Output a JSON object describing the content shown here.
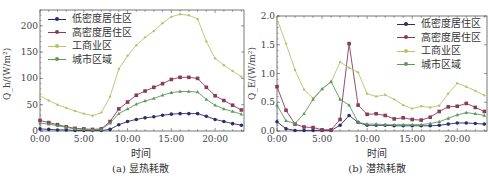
{
  "legend": [
    "低密度居住区",
    "高密度居住区",
    "工商业区",
    "城市区域"
  ],
  "colors": {
    "low": "#2b2d6b",
    "high": "#8a3a5a",
    "commercial": "#b5c46a",
    "urban": "#5a9a5a"
  },
  "chart_data": [
    {
      "type": "line",
      "title": "(a) 显热耗散",
      "xlabel": "时间",
      "ylabel": "Q_h/(W/m²)",
      "x_ticks": [
        "0:00",
        "5:00",
        "10:00",
        "15:00",
        "20:00"
      ],
      "y_ticks": [
        0,
        50,
        100,
        150,
        200
      ],
      "ylim": [
        0,
        230
      ],
      "x": [
        0,
        1,
        2,
        3,
        4,
        5,
        6,
        7,
        8,
        9,
        10,
        11,
        12,
        13,
        14,
        15,
        16,
        17,
        18,
        19,
        20,
        21,
        22,
        23
      ],
      "series": [
        {
          "name": "低密度居住区",
          "values": [
            4,
            3,
            2,
            2,
            1,
            1,
            1,
            1,
            3,
            12,
            18,
            22,
            25,
            27,
            30,
            32,
            33,
            33,
            33,
            28,
            22,
            18,
            14,
            11
          ]
        },
        {
          "name": "高密度居住区",
          "values": [
            20,
            16,
            12,
            8,
            5,
            4,
            3,
            4,
            18,
            42,
            55,
            68,
            76,
            83,
            90,
            98,
            102,
            102,
            100,
            83,
            67,
            58,
            49,
            40
          ]
        },
        {
          "name": "工商业区",
          "values": [
            67,
            58,
            50,
            44,
            38,
            33,
            29,
            35,
            65,
            118,
            143,
            163,
            178,
            190,
            205,
            217,
            222,
            220,
            213,
            170,
            138,
            125,
            114,
            103
          ]
        },
        {
          "name": "城市区域",
          "values": [
            15,
            13,
            10,
            7,
            4,
            3,
            2,
            3,
            15,
            33,
            42,
            51,
            57,
            62,
            68,
            73,
            75,
            75,
            74,
            60,
            49,
            42,
            37,
            32
          ]
        }
      ]
    },
    {
      "type": "line",
      "title": "(b) 潜热耗散",
      "xlabel": "时间",
      "ylabel": "Q_E/(W/m²)",
      "x_ticks": [
        "0:00",
        "5:00",
        "10:00",
        "15:00",
        "20:00"
      ],
      "y_ticks": [
        0.0,
        0.5,
        1.0,
        1.5,
        2.0
      ],
      "ylim": [
        0,
        2.0
      ],
      "x": [
        0,
        1,
        2,
        3,
        4,
        5,
        6,
        7,
        8,
        9,
        10,
        11,
        12,
        13,
        14,
        15,
        16,
        17,
        18,
        19,
        20,
        21,
        22,
        23
      ],
      "series": [
        {
          "name": "低密度居住区",
          "values": [
            0.16,
            0.04,
            0.01,
            0.01,
            0.01,
            0.01,
            0.01,
            0.1,
            0.27,
            0.15,
            0.1,
            0.1,
            0.1,
            0.09,
            0.09,
            0.09,
            0.09,
            0.09,
            0.1,
            0.12,
            0.14,
            0.14,
            0.13,
            0.12
          ]
        },
        {
          "name": "高密度居住区",
          "values": [
            0.77,
            0.36,
            0.12,
            0.07,
            0.06,
            0.02,
            0.02,
            0.2,
            1.52,
            0.45,
            0.29,
            0.3,
            0.27,
            0.21,
            0.23,
            0.2,
            0.19,
            0.24,
            0.34,
            0.42,
            0.43,
            0.48,
            0.41,
            0.34
          ]
        },
        {
          "name": "工商业区",
          "values": [
            1.95,
            1.52,
            1.06,
            0.72,
            0.57,
            0.73,
            0.85,
            1.2,
            1.1,
            1.02,
            0.65,
            0.6,
            0.63,
            0.55,
            0.45,
            0.39,
            0.43,
            0.41,
            0.44,
            0.65,
            0.83,
            0.77,
            0.7,
            0.62
          ]
        },
        {
          "name": "城市区域",
          "values": [
            0.45,
            0.18,
            0.13,
            0.3,
            0.55,
            0.73,
            0.86,
            0.55,
            0.45,
            0.15,
            0.12,
            0.12,
            0.11,
            0.11,
            0.11,
            0.11,
            0.11,
            0.13,
            0.16,
            0.22,
            0.28,
            0.32,
            0.3,
            0.27
          ]
        }
      ]
    }
  ]
}
